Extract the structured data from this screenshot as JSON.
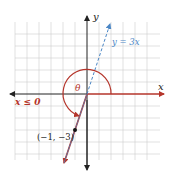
{
  "diagram": {
    "labels": {
      "x_axis": "x",
      "y_axis": "y",
      "line": "y = 3x",
      "angle": "θ",
      "domain": "x ≤ 0",
      "point": "(−1, −3)"
    },
    "colors": {
      "grid": "#c8c8c8",
      "axis": "#222222",
      "ray": "#b5352b",
      "line": "#4a86c5",
      "point": "#111111"
    },
    "grid": {
      "xmin": -6,
      "xmax": 6,
      "ymin": -5,
      "ymax": 6,
      "step": 1
    },
    "point": {
      "x": -1,
      "y": -3
    }
  }
}
